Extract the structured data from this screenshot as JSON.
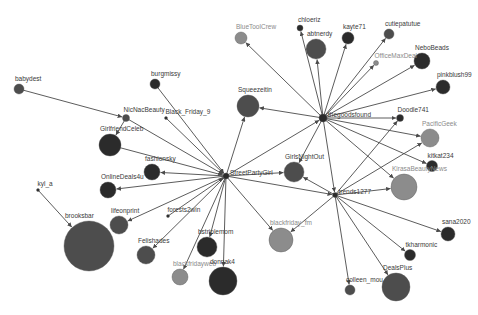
{
  "graph": {
    "title": "",
    "colors": {
      "dark": "#2b2b2b",
      "mid": "#4d4d4d",
      "light": "#8c8c8c",
      "edge": "#4a4a4a",
      "background": "#ffffff"
    },
    "hubs": [
      {
        "id": "StreetPartyGirl",
        "label": "StreetPartyGirl",
        "x": 226,
        "y": 176,
        "r": 3,
        "tone": "dark"
      },
      {
        "id": "thegoodsfound",
        "label": "thegoodsfound",
        "x": 323,
        "y": 118,
        "r": 4,
        "tone": "dark"
      },
      {
        "id": "trends1277",
        "label": "trends1277",
        "x": 335,
        "y": 195,
        "r": 2.5,
        "tone": "dark"
      }
    ],
    "nodes": [
      {
        "id": "babydest",
        "label": "babydest",
        "x": 19,
        "y": 89,
        "r": 5,
        "tone": "mid"
      },
      {
        "id": "burgmissy",
        "label": "burgmissy",
        "x": 155,
        "y": 84,
        "r": 5,
        "tone": "dark"
      },
      {
        "id": "NicNacBeauty",
        "label": "NicNacBeauty",
        "x": 126,
        "y": 118,
        "r": 3.5,
        "tone": "mid"
      },
      {
        "id": "Black_Friday_9",
        "label": "Black_Friday_9",
        "x": 166,
        "y": 118,
        "r": 1.5,
        "tone": "dark"
      },
      {
        "id": "GirlfriendCeleb",
        "label": "GirlfriendCeleb",
        "x": 110,
        "y": 145,
        "r": 11,
        "tone": "dark"
      },
      {
        "id": "fashionsky",
        "label": "fashionsky",
        "x": 152,
        "y": 172,
        "r": 8,
        "tone": "dark"
      },
      {
        "id": "OnlineDeals4u",
        "label": "OnlineDeals4u",
        "x": 108,
        "y": 190,
        "r": 8,
        "tone": "dark"
      },
      {
        "id": "kyl_a",
        "label": "kyl_a",
        "x": 38,
        "y": 190,
        "r": 1.5,
        "tone": "dark"
      },
      {
        "id": "brooksbar",
        "label": "brooksbar",
        "x": 89,
        "y": 246,
        "r": 25,
        "tone": "mid"
      },
      {
        "id": "lifeonprint",
        "label": "lifeonprint",
        "x": 119,
        "y": 225,
        "r": 9,
        "tone": "mid"
      },
      {
        "id": "forests2win",
        "label": "forests2win",
        "x": 168,
        "y": 216,
        "r": 1.5,
        "tone": "dark"
      },
      {
        "id": "Felishades",
        "label": "Felishades",
        "x": 146,
        "y": 255,
        "r": 9,
        "tone": "mid"
      },
      {
        "id": "bstriplemom",
        "label": "bstriplemom",
        "x": 207,
        "y": 247,
        "r": 10,
        "tone": "dark"
      },
      {
        "id": "blackfridayweb",
        "label": "blackfridayweb",
        "x": 180,
        "y": 277,
        "r": 8,
        "tone": "light"
      },
      {
        "id": "donnak4",
        "label": "donnak4",
        "x": 223,
        "y": 281,
        "r": 14,
        "tone": "dark"
      },
      {
        "id": "BlueToolCrew",
        "label": "BlueToolCrew",
        "x": 241,
        "y": 38,
        "r": 6,
        "tone": "light"
      },
      {
        "id": "chloeriz",
        "label": "chloeriz",
        "x": 300,
        "y": 28,
        "r": 3,
        "tone": "dark"
      },
      {
        "id": "abtnerdy",
        "label": "abtnerdy",
        "x": 316,
        "y": 49,
        "r": 10,
        "tone": "mid"
      },
      {
        "id": "kayte71",
        "label": "kayte71",
        "x": 348,
        "y": 38,
        "r": 6,
        "tone": "dark"
      },
      {
        "id": "cutiepatutue",
        "label": "cutiepatutue",
        "x": 389,
        "y": 34,
        "r": 5,
        "tone": "mid"
      },
      {
        "id": "OfficeMaxDeal",
        "label": "OfficeMaxDeal",
        "x": 376,
        "y": 63,
        "r": 2.5,
        "tone": "light"
      },
      {
        "id": "NeboBeads",
        "label": "NeboBeads",
        "x": 422,
        "y": 61,
        "r": 8,
        "tone": "dark"
      },
      {
        "id": "pinkblush99",
        "label": "pinkblush99",
        "x": 443,
        "y": 87,
        "r": 7,
        "tone": "dark"
      },
      {
        "id": "Squeezeitin",
        "label": "Squeezeitin",
        "x": 248,
        "y": 106,
        "r": 11,
        "tone": "mid"
      },
      {
        "id": "Doodle741",
        "label": "Doodle741",
        "x": 400,
        "y": 118,
        "r": 3.5,
        "tone": "dark"
      },
      {
        "id": "PacificGeek",
        "label": "PacificGeek",
        "x": 430,
        "y": 138,
        "r": 9,
        "tone": "light"
      },
      {
        "id": "kitkat234",
        "label": "kitkat234",
        "x": 432,
        "y": 166,
        "r": 5.5,
        "tone": "dark"
      },
      {
        "id": "GirlsNightOut",
        "label": "GirlsNightOut",
        "x": 294,
        "y": 172,
        "r": 10,
        "tone": "mid"
      },
      {
        "id": "KirasaBeautyNews",
        "label": "KirasaBeautyNews",
        "x": 404,
        "y": 187,
        "r": 13,
        "tone": "light"
      },
      {
        "id": "blackfriday_fm",
        "label": "blackfriday_fm",
        "x": 281,
        "y": 240,
        "r": 12,
        "tone": "light"
      },
      {
        "id": "sana2020",
        "label": "sana2020",
        "x": 448,
        "y": 234,
        "r": 7,
        "tone": "dark"
      },
      {
        "id": "tkharmonic",
        "label": "tkharmonic",
        "x": 410,
        "y": 255,
        "r": 5.5,
        "tone": "dark"
      },
      {
        "id": "colleen_mou",
        "label": "colleen_mou",
        "x": 350,
        "y": 290,
        "r": 5,
        "tone": "mid"
      },
      {
        "id": "DealsPlus",
        "label": "DealsPlus",
        "x": 396,
        "y": 287,
        "r": 14,
        "tone": "mid"
      }
    ],
    "edges": [
      [
        "babydest",
        "NicNacBeauty"
      ],
      [
        "NicNacBeauty",
        "GirlfriendCeleb"
      ],
      [
        "NicNacBeauty",
        "StreetPartyGirl"
      ],
      [
        "burgmissy",
        "StreetPartyGirl"
      ],
      [
        "Black_Friday_9",
        "StreetPartyGirl"
      ],
      [
        "GirlfriendCeleb",
        "StreetPartyGirl"
      ],
      [
        "StreetPartyGirl",
        "fashionsky"
      ],
      [
        "StreetPartyGirl",
        "OnlineDeals4u"
      ],
      [
        "kyl_a",
        "brooksbar"
      ],
      [
        "StreetPartyGirl",
        "lifeonprint"
      ],
      [
        "forests2win",
        "StreetPartyGirl"
      ],
      [
        "StreetPartyGirl",
        "Felishades"
      ],
      [
        "StreetPartyGirl",
        "bstriplemom"
      ],
      [
        "StreetPartyGirl",
        "blackfridayweb"
      ],
      [
        "StreetPartyGirl",
        "donnak4"
      ],
      [
        "StreetPartyGirl",
        "Squeezeitin"
      ],
      [
        "StreetPartyGirl",
        "GirlsNightOut"
      ],
      [
        "StreetPartyGirl",
        "blackfriday_fm"
      ],
      [
        "StreetPartyGirl",
        "thegoodsfound"
      ],
      [
        "StreetPartyGirl",
        "trends1277"
      ],
      [
        "thegoodsfound",
        "BlueToolCrew"
      ],
      [
        "thegoodsfound",
        "chloeriz"
      ],
      [
        "thegoodsfound",
        "abtnerdy"
      ],
      [
        "thegoodsfound",
        "kayte71"
      ],
      [
        "thegoodsfound",
        "cutiepatutue"
      ],
      [
        "thegoodsfound",
        "OfficeMaxDeal"
      ],
      [
        "thegoodsfound",
        "NeboBeads"
      ],
      [
        "thegoodsfound",
        "pinkblush99"
      ],
      [
        "thegoodsfound",
        "Squeezeitin"
      ],
      [
        "thegoodsfound",
        "Doodle741"
      ],
      [
        "thegoodsfound",
        "PacificGeek"
      ],
      [
        "thegoodsfound",
        "kitkat234"
      ],
      [
        "thegoodsfound",
        "GirlsNightOut"
      ],
      [
        "thegoodsfound",
        "trends1277"
      ],
      [
        "thegoodsfound",
        "KirasaBeautyNews"
      ],
      [
        "trends1277",
        "Doodle741"
      ],
      [
        "trends1277",
        "PacificGeek"
      ],
      [
        "trends1277",
        "GirlsNightOut"
      ],
      [
        "trends1277",
        "KirasaBeautyNews"
      ],
      [
        "trends1277",
        "blackfriday_fm"
      ],
      [
        "trends1277",
        "sana2020"
      ],
      [
        "trends1277",
        "tkharmonic"
      ],
      [
        "trends1277",
        "colleen_mou"
      ],
      [
        "trends1277",
        "DealsPlus"
      ]
    ]
  }
}
